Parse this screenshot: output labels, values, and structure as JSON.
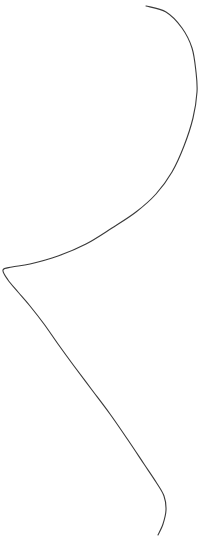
{
  "figure": {
    "title": "",
    "background_color": "#ffffff",
    "width": 204,
    "height": 551,
    "clipped_caption_text": ""
  },
  "curve": {
    "name": "s-curve",
    "stroke_color": "#3a3a3a",
    "stroke_width": 1.1,
    "fill": "none",
    "linecap": "round",
    "path": "M 146 6 C 172 14 190 40 196 72 C 201 104 193 140 176 166 C 160 190 136 212 104 232 C 72 252 34 264 14 266 C 4 267 1 270 3 274 C 6 280 16 288 26 300 C 38 314 50 332 64 352 C 82 378 104 406 126 436 C 146 464 162 482 165 496 C 167 510 163 524 158 535"
  },
  "chart_data": {
    "type": "line",
    "title": "",
    "xlabel": "",
    "ylabel": "",
    "xlim": [
      0,
      204
    ],
    "ylim": [
      551,
      0
    ],
    "grid": false,
    "legend": null,
    "series": [
      {
        "name": "s-curve",
        "points": [
          [
            146,
            6
          ],
          [
            166,
            12
          ],
          [
            182,
            28
          ],
          [
            192,
            48
          ],
          [
            196,
            72
          ],
          [
            197,
            92
          ],
          [
            193,
            118
          ],
          [
            184,
            146
          ],
          [
            172,
            172
          ],
          [
            156,
            194
          ],
          [
            136,
            212
          ],
          [
            112,
            228
          ],
          [
            86,
            244
          ],
          [
            58,
            256
          ],
          [
            30,
            264
          ],
          [
            12,
            267
          ],
          [
            3,
            270
          ],
          [
            8,
            280
          ],
          [
            18,
            292
          ],
          [
            30,
            306
          ],
          [
            44,
            324
          ],
          [
            58,
            344
          ],
          [
            74,
            366
          ],
          [
            92,
            390
          ],
          [
            110,
            414
          ],
          [
            128,
            440
          ],
          [
            144,
            464
          ],
          [
            156,
            482
          ],
          [
            164,
            496
          ],
          [
            166,
            510
          ],
          [
            163,
            524
          ],
          [
            158,
            535
          ]
        ]
      }
    ]
  }
}
